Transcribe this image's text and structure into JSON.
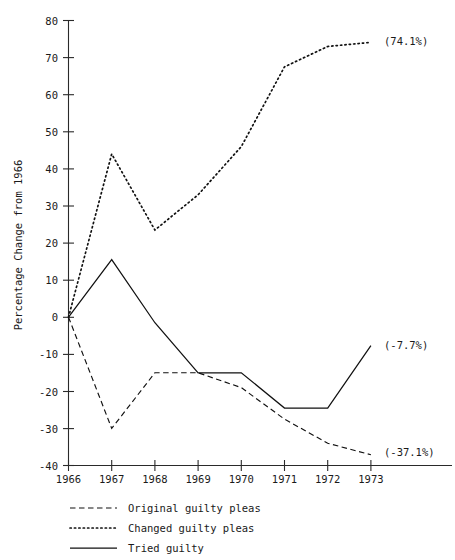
{
  "chart_data": {
    "type": "line",
    "title": "",
    "xlabel": "",
    "ylabel": "Percentage Change from 1966",
    "x": [
      1966,
      1967,
      1968,
      1969,
      1970,
      1971,
      1972,
      1973
    ],
    "xtick_labels": [
      "1966",
      "1967",
      "1968",
      "1969",
      "1970",
      "1971",
      "1972",
      "1973"
    ],
    "ytick_labels": [
      "80",
      "70",
      "60",
      "50",
      "40",
      "30",
      "20",
      "10",
      "0",
      "-10",
      "-20",
      "-30",
      "-40"
    ],
    "ytick_values": [
      80,
      70,
      60,
      50,
      40,
      30,
      20,
      10,
      0,
      -10,
      -20,
      -30,
      -40
    ],
    "ylim": [
      -40,
      80
    ],
    "xlim": [
      1966,
      1973
    ],
    "grid": false,
    "legend_position": "below-axes",
    "series": [
      {
        "name": "Original guilty pleas",
        "style": "dashed",
        "values": [
          0,
          -30,
          -15,
          -15,
          -19,
          -27.5,
          -34,
          -37.1
        ],
        "end_annotation": "(-37.1%)"
      },
      {
        "name": "Changed guilty pleas",
        "style": "dotted",
        "values": [
          0,
          44,
          23.5,
          33,
          46,
          67.5,
          73,
          74.1
        ],
        "end_annotation": "(74.1%)"
      },
      {
        "name": "Tried guilty",
        "style": "solid",
        "values": [
          0,
          15.5,
          -1.5,
          -15,
          -15,
          -24.5,
          -24.5,
          -7.7
        ],
        "end_annotation": "(-7.7%)"
      }
    ],
    "annotations": [
      {
        "text": "(74.1%)",
        "series": "Changed guilty pleas",
        "x": 1973,
        "y": 74.1
      },
      {
        "text": "(-7.7%)",
        "series": "Tried guilty",
        "x": 1973,
        "y": -7.7
      },
      {
        "text": "(-37.1%)",
        "series": "Original guilty pleas",
        "x": 1973,
        "y": -37.1
      }
    ],
    "legend": [
      {
        "label": "Original guilty pleas",
        "style": "dashed"
      },
      {
        "label": "Changed guilty pleas",
        "style": "dotted"
      },
      {
        "label": "Tried guilty",
        "style": "solid"
      }
    ],
    "colors": {
      "ink": "#111111",
      "axis": "#2a2a2a",
      "background": "#ffffff"
    }
  }
}
